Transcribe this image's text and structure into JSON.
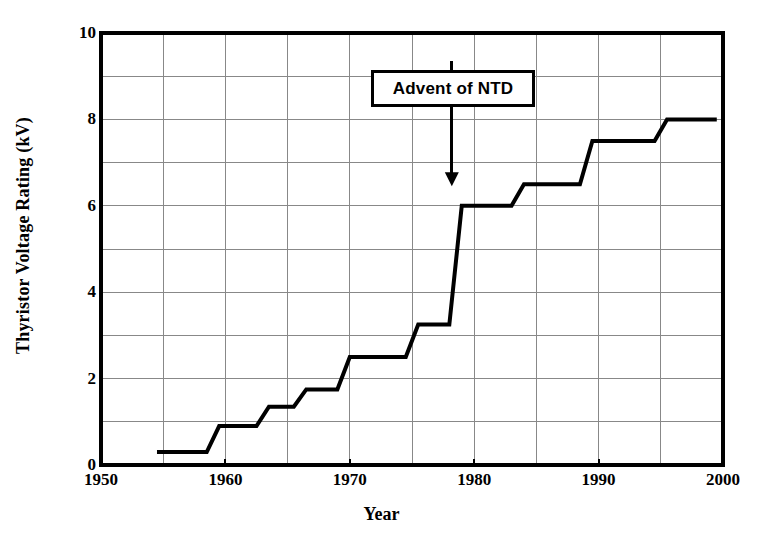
{
  "chart_data": {
    "type": "line",
    "title": "",
    "xlabel": "Year",
    "ylabel": "Thyristor Voltage Rating (kV)",
    "xlim": [
      1950,
      2000
    ],
    "ylim": [
      0,
      10
    ],
    "xticks": [
      1950,
      1960,
      1970,
      1980,
      1990,
      2000
    ],
    "xtick_labels": [
      "1950",
      "1960",
      "1970",
      "1980",
      "1990",
      "2000"
    ],
    "yticks": [
      0,
      2,
      4,
      6,
      8,
      10
    ],
    "ytick_labels": [
      "0",
      "2",
      "4",
      "6",
      "8",
      "10"
    ],
    "grid": true,
    "grid_x_step": 5,
    "grid_y_step": 1,
    "legend": null,
    "series": [
      {
        "name": "Thyristor voltage rating",
        "step": "post",
        "x": [
          1954.5,
          1958.5,
          1959.5,
          1962.5,
          1963.5,
          1965.5,
          1966.5,
          1969.0,
          1970.0,
          1974.5,
          1975.5,
          1978.0,
          1979.0,
          1983.0,
          1984.0,
          1988.5,
          1989.5,
          1994.5,
          1995.5,
          1999.5
        ],
        "y": [
          0.3,
          0.3,
          0.9,
          0.9,
          1.35,
          1.35,
          1.75,
          1.75,
          2.5,
          2.5,
          3.25,
          3.25,
          6.0,
          6.0,
          6.5,
          6.5,
          7.5,
          7.5,
          8.0,
          8.0
        ],
        "points": [
          {
            "year": 1954.5,
            "kv": 0.3
          },
          {
            "year": 1958.5,
            "kv": 0.3
          },
          {
            "year": 1959.5,
            "kv": 0.9
          },
          {
            "year": 1962.5,
            "kv": 0.9
          },
          {
            "year": 1963.5,
            "kv": 1.35
          },
          {
            "year": 1965.5,
            "kv": 1.35
          },
          {
            "year": 1966.5,
            "kv": 1.75
          },
          {
            "year": 1969.0,
            "kv": 1.75
          },
          {
            "year": 1970.0,
            "kv": 2.5
          },
          {
            "year": 1974.5,
            "kv": 2.5
          },
          {
            "year": 1975.5,
            "kv": 3.25
          },
          {
            "year": 1978.0,
            "kv": 3.25
          },
          {
            "year": 1979.0,
            "kv": 6.0
          },
          {
            "year": 1983.0,
            "kv": 6.0
          },
          {
            "year": 1984.0,
            "kv": 6.5
          },
          {
            "year": 1988.5,
            "kv": 6.5
          },
          {
            "year": 1989.5,
            "kv": 7.5
          },
          {
            "year": 1994.5,
            "kv": 7.5
          },
          {
            "year": 1995.5,
            "kv": 8.0
          },
          {
            "year": 1999.5,
            "kv": 8.0
          }
        ],
        "color": "#000000",
        "line_width": 4
      }
    ],
    "annotations": [
      {
        "text": "Advent of NTD",
        "box_x": 1977.5,
        "box_y": 9.0,
        "arrow_tip_x": 1978.2,
        "arrow_tip_y": 6.45
      }
    ]
  },
  "axes": {
    "frame_color": "#000000",
    "grid_color": "#888888",
    "background": "#ffffff"
  }
}
